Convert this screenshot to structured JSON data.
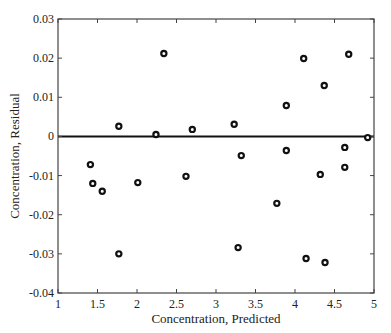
{
  "chart_data": {
    "type": "scatter",
    "title": "",
    "xlabel": "Concentration, Predicted",
    "ylabel": "Concentration, Residual",
    "xlim": [
      1,
      5
    ],
    "ylim": [
      -0.04,
      0.03
    ],
    "xticks": [
      1,
      1.5,
      2,
      2.5,
      3,
      3.5,
      4,
      4.5,
      5
    ],
    "xtick_labels": [
      "1",
      "1.5",
      "2",
      "2.5",
      "3",
      "3.5",
      "4",
      "4.5",
      "5"
    ],
    "yticks": [
      -0.04,
      -0.03,
      -0.02,
      -0.01,
      0,
      0.01,
      0.02,
      0.03
    ],
    "ytick_labels": [
      "-0.04",
      "-0.03",
      "-0.02",
      "-0.01",
      "0",
      "0.01",
      "0.02",
      "0.03"
    ],
    "grid": false,
    "reference_line": {
      "y": 0
    },
    "series": [
      {
        "name": "residuals",
        "marker": "open-circle",
        "x": [
          1.41,
          1.44,
          1.56,
          1.77,
          1.77,
          2.01,
          2.24,
          2.34,
          2.62,
          2.7,
          3.23,
          3.28,
          3.32,
          3.77,
          3.89,
          3.89,
          4.11,
          4.14,
          4.32,
          4.37,
          4.38,
          4.63,
          4.63,
          4.68,
          4.92
        ],
        "y": [
          -0.0072,
          -0.012,
          -0.014,
          0.0026,
          -0.03,
          -0.0118,
          0.0005,
          0.0212,
          -0.0102,
          0.0018,
          0.0031,
          -0.0284,
          -0.0049,
          -0.0171,
          0.0079,
          -0.0036,
          0.0199,
          -0.0312,
          -0.0097,
          0.013,
          -0.0322,
          -0.0028,
          -0.0079,
          0.021,
          -0.0003
        ]
      }
    ]
  }
}
